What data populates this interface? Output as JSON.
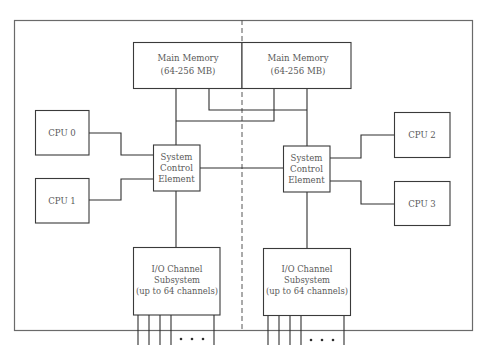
{
  "diagram": {
    "type": "multiprocessor-architecture",
    "colors": {
      "line": "#2e2e2e",
      "text": "#5a5a5a",
      "frame": "#6a6a6a",
      "background": "#ffffff"
    },
    "main_memory": [
      {
        "id": "mem-left",
        "line1": "Main Memory",
        "line2": "(64-256 MB)"
      },
      {
        "id": "mem-right",
        "line1": "Main Memory",
        "line2": "(64-256 MB)"
      }
    ],
    "cpus": [
      {
        "id": "cpu0",
        "label": "CPU 0"
      },
      {
        "id": "cpu1",
        "label": "CPU 1"
      },
      {
        "id": "cpu2",
        "label": "CPU 2"
      },
      {
        "id": "cpu3",
        "label": "CPU 3"
      }
    ],
    "system_control_elements": [
      {
        "id": "sce-left",
        "line1": "System",
        "line2": "Control",
        "line3": "Element"
      },
      {
        "id": "sce-right",
        "line1": "System",
        "line2": "Control",
        "line3": "Element"
      }
    ],
    "io_subsystems": [
      {
        "id": "io-left",
        "line1": "I/O Channel",
        "line2": "Subsystem",
        "line3": "(up to 64 channels)",
        "visible_channel_lines": 5,
        "ellipsis": "• • •"
      },
      {
        "id": "io-right",
        "line1": "I/O Channel",
        "line2": "Subsystem",
        "line3": "(up to 64 channels)",
        "visible_channel_lines": 5,
        "ellipsis": "• • •"
      }
    ]
  }
}
